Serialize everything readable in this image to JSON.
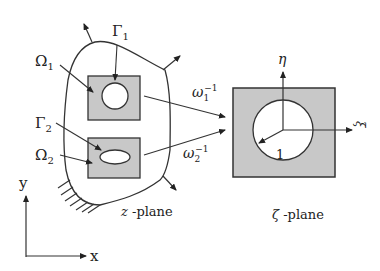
{
  "diagram": {
    "type": "conformal-mapping",
    "left_plane": {
      "label_var": "z",
      "label_suffix": " -plane",
      "regions": [
        {
          "name": "Omega1",
          "label": "Ω",
          "sub": "1",
          "hole_shape": "circle"
        },
        {
          "name": "Omega2",
          "label": "Ω",
          "sub": "2",
          "hole_shape": "ellipse"
        }
      ],
      "boundaries": [
        {
          "name": "Gamma1",
          "label": "Γ",
          "sub": "1"
        },
        {
          "name": "Gamma2",
          "label": "Γ",
          "sub": "2"
        }
      ],
      "axes": {
        "x": "x",
        "y": "y"
      }
    },
    "mappings": [
      {
        "label": "ω",
        "sub": "1",
        "sup": "−1"
      },
      {
        "label": "ω",
        "sub": "2",
        "sup": "−1"
      }
    ],
    "right_plane": {
      "label_var": "ζ",
      "label_suffix": " -plane",
      "axes": {
        "eta": "η",
        "xi": "ξ"
      },
      "radius_label": "1"
    },
    "colors": {
      "fill_gray": "#c8c8c8",
      "stroke": "#333333"
    }
  }
}
